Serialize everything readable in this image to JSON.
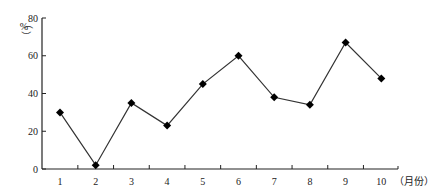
{
  "chart_data": {
    "type": "line",
    "title": "",
    "xlabel": "（月份）",
    "ylabel": "（%）",
    "categories": [
      "1",
      "2",
      "3",
      "4",
      "5",
      "6",
      "7",
      "8",
      "9",
      "10"
    ],
    "series": [
      {
        "name": "",
        "values": [
          30,
          2,
          35,
          23,
          45,
          60,
          38,
          34,
          67,
          48
        ],
        "marker": "diamond",
        "color": "#000000"
      }
    ],
    "ylim": [
      0,
      80
    ],
    "yticks": [
      0,
      20,
      40,
      60,
      80
    ],
    "grid": false,
    "legend": "none"
  },
  "axis": {
    "y_unit_open": "（",
    "y_unit": "%",
    "y_unit_close": "）",
    "x_unit": "（月份）"
  }
}
